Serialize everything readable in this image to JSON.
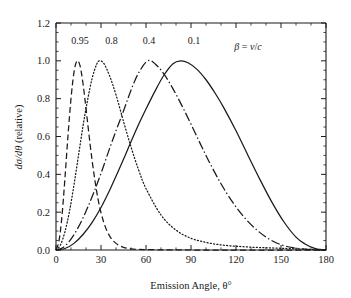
{
  "chart_data": {
    "type": "line",
    "title": "",
    "xlabel": "Emission Angle, θ°",
    "ylabel": "dσ/dθ (relative)",
    "xlim": [
      0,
      180
    ],
    "ylim": [
      0.0,
      1.2
    ],
    "xticks": [
      0,
      30,
      60,
      90,
      120,
      150,
      180
    ],
    "xtick_labels": [
      "0",
      "30",
      "60",
      "90",
      "120",
      "150",
      "180"
    ],
    "yticks": [
      0.0,
      0.2,
      0.4,
      0.6,
      0.8,
      1.0,
      1.2
    ],
    "ytick_labels": [
      "0.0",
      "0.2",
      "0.4",
      "0.6",
      "0.8",
      "1.0",
      "1.2"
    ],
    "xminor_step": 10,
    "yminor_step": 0.05,
    "grid": false,
    "legend_position": "inline-above-curves",
    "legend_note": "β = v/c",
    "series": [
      {
        "name": "0.95",
        "label": "0.95",
        "linestyle": "dashed",
        "color": "#1a1a1a",
        "peak_angle_deg": 14,
        "peak_value": 1.0,
        "width_deg": 11,
        "label_x_deg": 16,
        "label_y": 1.105,
        "x": [
          0,
          2,
          4,
          6,
          8,
          10,
          12,
          14,
          16,
          18,
          20,
          24,
          28,
          32,
          36,
          40,
          45,
          50,
          55,
          60,
          70,
          80,
          90,
          100,
          110,
          120,
          135,
          150,
          165,
          180
        ],
        "y": [
          0.0,
          0.048,
          0.182,
          0.383,
          0.605,
          0.8,
          0.94,
          1.0,
          0.975,
          0.88,
          0.748,
          0.478,
          0.27,
          0.142,
          0.071,
          0.035,
          0.014,
          0.006,
          0.003,
          0.002,
          0.001,
          0.001,
          0.0,
          0.0,
          0.0,
          0.0,
          0.0,
          0.0,
          0.0,
          0.0
        ]
      },
      {
        "name": "0.8",
        "label": "0.8",
        "linestyle": "dotted",
        "color": "#1a1a1a",
        "peak_angle_deg": 29,
        "peak_value": 1.0,
        "width_deg": 21,
        "label_x_deg": 37,
        "label_y": 1.105,
        "x": [
          0,
          3,
          6,
          9,
          12,
          15,
          18,
          21,
          24,
          27,
          29,
          32,
          36,
          40,
          45,
          50,
          55,
          60,
          70,
          80,
          90,
          100,
          110,
          120,
          130,
          140,
          150,
          160,
          170,
          180
        ],
        "y": [
          0.0,
          0.027,
          0.098,
          0.205,
          0.345,
          0.5,
          0.655,
          0.79,
          0.905,
          0.98,
          1.0,
          0.985,
          0.915,
          0.82,
          0.68,
          0.545,
          0.425,
          0.325,
          0.185,
          0.105,
          0.062,
          0.04,
          0.027,
          0.02,
          0.015,
          0.012,
          0.009,
          0.006,
          0.003,
          0.0
        ]
      },
      {
        "name": "0.4",
        "label": "0.4",
        "linestyle": "dashdot",
        "color": "#1a1a1a",
        "peak_angle_deg": 61,
        "peak_value": 1.0,
        "width_deg": 38,
        "label_x_deg": 62,
        "label_y": 1.105,
        "x": [
          0,
          5,
          10,
          15,
          20,
          25,
          30,
          35,
          40,
          45,
          50,
          55,
          61,
          66,
          72,
          78,
          84,
          90,
          96,
          102,
          110,
          118,
          126,
          134,
          142,
          150,
          158,
          166,
          173,
          180
        ],
        "y": [
          0.0,
          0.015,
          0.058,
          0.122,
          0.205,
          0.3,
          0.405,
          0.52,
          0.63,
          0.735,
          0.845,
          0.935,
          1.0,
          0.985,
          0.93,
          0.852,
          0.762,
          0.665,
          0.565,
          0.468,
          0.35,
          0.25,
          0.168,
          0.105,
          0.058,
          0.028,
          0.012,
          0.004,
          0.001,
          0.0
        ]
      },
      {
        "name": "0.1",
        "label": "0.1",
        "linestyle": "solid",
        "color": "#1a1a1a",
        "peak_angle_deg": 83,
        "peak_value": 1.0,
        "width_deg": 48,
        "label_x_deg": 92,
        "label_y": 1.105,
        "x": [
          0,
          6,
          12,
          18,
          24,
          30,
          36,
          42,
          48,
          54,
          60,
          66,
          72,
          78,
          83,
          88,
          94,
          100,
          106,
          112,
          120,
          128,
          136,
          144,
          152,
          160,
          166,
          172,
          176,
          180
        ],
        "y": [
          0.0,
          0.008,
          0.035,
          0.082,
          0.145,
          0.225,
          0.32,
          0.425,
          0.535,
          0.645,
          0.745,
          0.84,
          0.925,
          0.985,
          1.0,
          0.99,
          0.955,
          0.9,
          0.83,
          0.75,
          0.63,
          0.5,
          0.372,
          0.252,
          0.148,
          0.068,
          0.032,
          0.01,
          0.003,
          0.0
        ]
      }
    ]
  },
  "figure": {
    "background_color": "#ffffff",
    "axis_color": "#1a1a1a",
    "line_color": "#1a1a1a"
  }
}
